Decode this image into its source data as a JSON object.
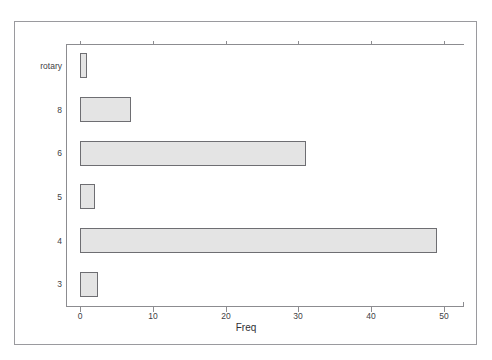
{
  "clipped_header_text": "",
  "chart_data": {
    "type": "bar",
    "orientation": "horizontal",
    "title": "",
    "subtitle": "",
    "xlabel": "Freq",
    "ylabel": "",
    "categories": [
      "3",
      "4",
      "5",
      "6",
      "8",
      "rotary"
    ],
    "values": [
      2.5,
      49,
      2,
      31,
      7,
      1
    ],
    "series": [
      {
        "name": "Freq",
        "values": [
          2.5,
          49,
          2,
          31,
          7,
          1
        ]
      }
    ],
    "category_order_top_to_bottom": [
      "rotary",
      "8",
      "6",
      "5",
      "4",
      "3"
    ],
    "values_top_to_bottom": [
      1,
      7,
      31,
      2,
      49,
      2.5
    ],
    "xlim": [
      0,
      54.5
    ],
    "ylim": [
      0,
      6
    ],
    "xticks": [
      0,
      10,
      20,
      30,
      40,
      50
    ],
    "xtick_labels": [
      "0",
      "10",
      "20",
      "30",
      "40",
      "50"
    ],
    "ytick_labels": [
      "rotary",
      "8",
      "6",
      "5",
      "4",
      "3"
    ],
    "grid": false,
    "legend": false,
    "legend_position": "none",
    "bar_fill_color": "#e4e4e4",
    "bar_border_color": "#6e6e72",
    "axis_color": "#8c8c90",
    "text_color": "#404044",
    "background_color": "#ffffff",
    "frame": true
  }
}
